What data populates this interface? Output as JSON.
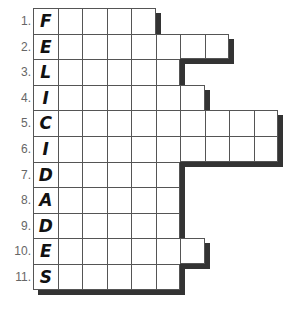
{
  "puzzle": {
    "grid_origin": {
      "x": 33,
      "y": 8
    },
    "cell_width": 24.5,
    "row_height": 25.6,
    "shadow_color": "#333333",
    "rows": [
      {
        "number": "1.",
        "letter": "F",
        "length": 5
      },
      {
        "number": "2.",
        "letter": "E",
        "length": 8
      },
      {
        "number": "3.",
        "letter": "L",
        "length": 6
      },
      {
        "number": "4.",
        "letter": "I",
        "length": 7
      },
      {
        "number": "5.",
        "letter": "C",
        "length": 10
      },
      {
        "number": "6.",
        "letter": "I",
        "length": 10
      },
      {
        "number": "7.",
        "letter": "D",
        "length": 6
      },
      {
        "number": "8.",
        "letter": "A",
        "length": 6
      },
      {
        "number": "9.",
        "letter": "D",
        "length": 6
      },
      {
        "number": "10.",
        "letter": "E",
        "length": 7
      },
      {
        "number": "11.",
        "letter": "S",
        "length": 6
      }
    ]
  }
}
